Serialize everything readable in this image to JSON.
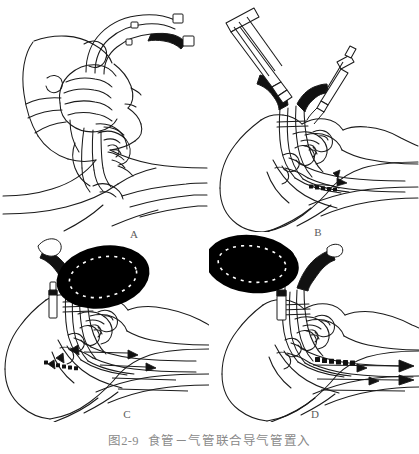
{
  "figure": {
    "caption_number": "图2-9",
    "caption_title": "食管－气管联合导气管置入",
    "background_color": "#ffffff",
    "ink_color": "#1a1a1a",
    "label_color": "#5d5d5d",
    "caption_color": "#8a8a8a",
    "fill_black": "#000000",
    "layout": "2x2 grid of line-art illustrations with letter labels below each panel and a centered caption at the bottom"
  },
  "panels": [
    {
      "label": "A",
      "name": "panel-a-insertion",
      "alt": "Line drawing: a gloved hand opens the patient's mouth and inserts the esophageal-tracheal double-lumen combitube; head shown in left profile, two lumen tubes curve up and to the right ending in rectangular connectors, one lumen drawn solid black.",
      "features": [
        "hand",
        "head-profile",
        "double-lumen-tube",
        "tube-connectors",
        "tongue",
        "jaw"
      ]
    },
    {
      "label": "B",
      "name": "panel-b-cuff-inflation",
      "alt": "Line drawing: the combitube is in place in the pharynx; a large barrel syringe inflates the proximal pharyngeal cuff and a small syringe inflates the distal cuff; sagittal section of the airway with the tube tip in the esophagus.",
      "features": [
        "large-syringe",
        "small-syringe",
        "pharyngeal-cuff",
        "distal-cuff",
        "airway-sagittal-section",
        "head-profile"
      ]
    },
    {
      "label": "C",
      "name": "panel-c-esophageal-ventilation",
      "alt": "Line drawing: a black self-inflating ventilation bag is attached to the longer pharyngeal lumen; arrows show gas passing out of the side perforations into the larynx and trachea while the esophagus is blocked by the distal cuff.",
      "features": [
        "ventilation-bag",
        "airflow-arrows",
        "pharyngeal-lumen",
        "distal-cuff",
        "airway-sagittal-section"
      ]
    },
    {
      "label": "D",
      "name": "panel-d-tracheal-ventilation",
      "alt": "Line drawing: the black ventilation bag is attached to the shorter tracheal lumen; arrows show gas flowing directly down the trachea into the lungs when the tube tip has entered the trachea.",
      "features": [
        "ventilation-bag",
        "airflow-arrows",
        "tracheal-lumen",
        "airway-sagittal-section"
      ]
    }
  ]
}
